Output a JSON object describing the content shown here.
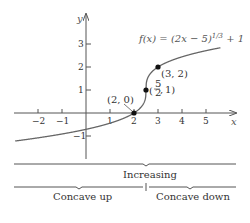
{
  "chart_data": {
    "type": "line",
    "title": "",
    "function_label": "f(x) = (2x − 5)^{1/3} + 1",
    "xlabel": "x",
    "ylabel": "y",
    "xlim": [
      -2.5,
      5.5
    ],
    "ylim": [
      -1.5,
      3.5
    ],
    "x_ticks": [
      "−2",
      "−1",
      "1",
      "2",
      "3",
      "4",
      "5"
    ],
    "y_ticks": [
      "−1",
      "1",
      "2",
      "3"
    ],
    "points": [
      {
        "label": "(2, 0)",
        "x": 2,
        "y": 0
      },
      {
        "label": "(5/2, 1)",
        "x": 2.5,
        "y": 1
      },
      {
        "label": "(3, 2)",
        "x": 3,
        "y": 2
      }
    ],
    "intervals": {
      "monotonic": "Increasing",
      "concavity": [
        "Concave up",
        "Concave down"
      ]
    }
  },
  "axes": {
    "x_label": "x",
    "y_label": "y",
    "x_ticks": [
      {
        "v": -2,
        "t": "−2"
      },
      {
        "v": -1,
        "t": "−1"
      },
      {
        "v": 1,
        "t": "1"
      },
      {
        "v": 2,
        "t": "2"
      },
      {
        "v": 3,
        "t": "3"
      },
      {
        "v": 4,
        "t": "4"
      },
      {
        "v": 5,
        "t": "5"
      }
    ],
    "y_ticks": [
      {
        "v": -1,
        "t": "−1"
      },
      {
        "v": 1,
        "t": "1"
      },
      {
        "v": 2,
        "t": "2"
      },
      {
        "v": 3,
        "t": "3"
      }
    ]
  },
  "labels": {
    "func_main": "f(x) = (2x − 5)",
    "func_exp": "1/3",
    "func_tail": " + 1",
    "pt_20": "(2, 0)",
    "pt_31": "1)",
    "pt_32": "(3, 2)",
    "frac_num": "5",
    "frac_den": "2",
    "increasing": "Increasing",
    "concave_up": "Concave up",
    "concave_down": "Concave down"
  }
}
